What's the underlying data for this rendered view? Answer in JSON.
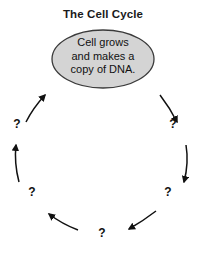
{
  "diagram": {
    "title": "The Cell Cycle",
    "type": "cycle-diagram",
    "direction": "counter-clockwise",
    "colors": {
      "node_fill": "#d4d4d4",
      "node_stroke": "#3a3a3a",
      "arrow": "#111111",
      "text": "#111111",
      "background": "#ffffff"
    },
    "center_node": {
      "shape": "ellipse",
      "lines": [
        "Cell grows",
        "and makes a",
        "copy of DNA."
      ],
      "full_text": "Cell grows and makes a copy of DNA."
    },
    "unknown_steps": [
      {
        "id": "step-upper-left",
        "label": "?",
        "x": 10,
        "y": 117
      },
      {
        "id": "step-upper-right",
        "label": "?",
        "x": 166,
        "y": 117
      },
      {
        "id": "step-lower-left",
        "label": "?",
        "x": 25,
        "y": 185
      },
      {
        "id": "step-lower-right",
        "label": "?",
        "x": 161,
        "y": 185
      },
      {
        "id": "step-bottom",
        "label": "?",
        "x": 95,
        "y": 226
      }
    ],
    "arrows": [
      {
        "id": "arrow-upper-left-to-node",
        "from": "step-upper-left",
        "to": "center_node",
        "points": "up-right"
      },
      {
        "id": "arrow-node-to-upper-right",
        "from": "center_node",
        "to": "step-upper-right",
        "points": "down-right"
      },
      {
        "id": "arrow-lower-left-to-upper-left",
        "from": "step-lower-left",
        "to": "step-upper-left",
        "points": "up"
      },
      {
        "id": "arrow-upper-right-to-lower-right",
        "from": "step-upper-right",
        "to": "step-lower-right",
        "points": "down"
      },
      {
        "id": "arrow-bottom-to-lower-left",
        "from": "step-bottom",
        "to": "step-lower-left",
        "points": "up-left"
      },
      {
        "id": "arrow-lower-right-to-bottom",
        "from": "step-lower-right",
        "to": "step-bottom",
        "points": "down-left"
      }
    ]
  }
}
